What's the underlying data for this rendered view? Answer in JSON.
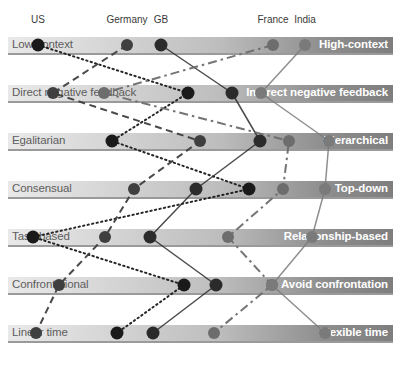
{
  "figure": {
    "type": "parallel-coordinates-scale",
    "width": 411,
    "height": 369
  },
  "countries": [
    {
      "name": "US",
      "color": "#1a1a1a",
      "line_style": "dotted",
      "head_x": 38,
      "head_label_y": 14
    },
    {
      "name": "Germany",
      "color": "#3f3f3f",
      "line_style": "dashed",
      "head_x": 127,
      "head_label_y": 14
    },
    {
      "name": "GB",
      "color": "#2b2b2b",
      "line_style": "solid",
      "head_x": 161,
      "head_label_y": 14
    },
    {
      "name": "France",
      "color": "#6d6d6d",
      "line_style": "dashdot",
      "head_x": 273,
      "head_label_y": 14
    },
    {
      "name": "India",
      "color": "#7a7a7a",
      "line_style": "solid",
      "head_x": 305,
      "head_label_y": 14
    }
  ],
  "dimensions": [
    {
      "left_label": "Low-context",
      "right_label": "High-context",
      "band_top": 37
    },
    {
      "left_label": "Direct negative feedback",
      "right_label": "Indirect negative feedback",
      "band_top": 85
    },
    {
      "left_label": "Egalitarian",
      "right_label": "Hierarchical",
      "band_top": 133
    },
    {
      "left_label": "Consensual",
      "right_label": "Top-down",
      "band_top": 181
    },
    {
      "left_label": "Task-based",
      "right_label": "Relationship-based",
      "band_top": 229
    },
    {
      "left_label": "Confrontational",
      "right_label": "Avoid confrontation",
      "band_top": 277
    },
    {
      "left_label": "Linear time",
      "right_label": "Flexible time",
      "band_top": 325
    }
  ],
  "chart_data": {
    "type": "line",
    "xlabel": "",
    "ylabel": "",
    "categories": [
      "Low-context / High-context",
      "Direct negative feedback / Indirect negative feedback",
      "Egalitarian / Hierarchical",
      "Consensual / Top-down",
      "Task-based / Relationship-based",
      "Confrontational / Avoid confrontation",
      "Linear time / Flexible time"
    ],
    "series": [
      {
        "name": "US",
        "color": "#1a1a1a",
        "line_style": "dotted",
        "values": [
          38,
          188,
          112,
          249,
          33,
          184,
          117
        ]
      },
      {
        "name": "Germany",
        "color": "#3f3f3f",
        "line_style": "dashed",
        "values": [
          127,
          53,
          200,
          134,
          105,
          59,
          36
        ]
      },
      {
        "name": "GB",
        "color": "#2b2b2b",
        "line_style": "solid",
        "values": [
          161,
          232,
          260,
          196,
          150,
          216,
          153
        ]
      },
      {
        "name": "France",
        "color": "#6d6d6d",
        "line_style": "dashdot",
        "values": [
          273,
          104,
          289,
          283,
          228,
          272,
          214
        ]
      },
      {
        "name": "India",
        "color": "#7a7a7a",
        "line_style": "solid",
        "values": [
          305,
          261,
          329,
          325,
          312,
          272,
          325
        ]
      }
    ],
    "row_y": [
      45,
      93,
      141,
      189,
      237,
      285,
      333
    ],
    "axis_range_px": [
      8,
      393
    ],
    "grid": false,
    "legend": "top"
  },
  "colors": {
    "band_light": "#e9e9e9",
    "band_dark": "#7e7e7e",
    "underline": "#9a9a9a",
    "left_text": "#5d5d5d",
    "right_text": "#ffffff",
    "head_text": "#3a3a3a"
  }
}
